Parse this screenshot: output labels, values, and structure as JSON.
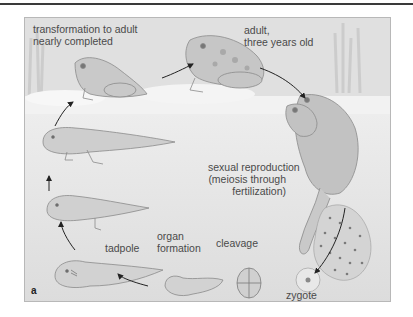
{
  "figure": {
    "panel_letter": "a",
    "background_color": "#e2e2e2",
    "accent_color": "#4a4a4a",
    "stages": [
      {
        "id": "transformation",
        "label_line1": "transformation to adult",
        "label_line2": "nearly completed"
      },
      {
        "id": "adult",
        "label_line1": "adult,",
        "label_line2": "three years old"
      },
      {
        "id": "reproduction",
        "label_line1": "sexual reproduction",
        "label_line2": "(meiosis through",
        "label_line3": "fertilization)"
      },
      {
        "id": "zygote",
        "label_line1": "zygote"
      },
      {
        "id": "cleavage",
        "label_line1": "cleavage"
      },
      {
        "id": "organ-formation",
        "label_line1": "organ",
        "label_line2": "formation"
      },
      {
        "id": "tadpole",
        "label_line1": "tadpole"
      }
    ],
    "icons": [
      "frog-icon",
      "tadpole-icon",
      "embryo-icon",
      "egg-mass-icon",
      "arrow-icon"
    ]
  }
}
